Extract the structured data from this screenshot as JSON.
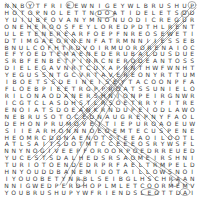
{
  "puzzle": {
    "type": "word-search",
    "columns": 25,
    "rows_count": 24,
    "letter_color": "#3a3a3a",
    "mark_color": "#8a8a8a",
    "rows": [
      "NNBYTFRIEEWNIGEYWLBRUSHUP",
      "HOTOPNOLETTNDOATIDELETSDD",
      "YUIUBFOVANYMNONUODICREGUR",
      "ONEHEROOSFEYLOREDPDTHLRENT",
      "ULETENEREARFOEPFNREOSEWETI",
      "DTIMGAEORNENFATRMNNIIESSEB",
      "BNULCOFHTRDVOIRMUORORENAIOC",
      "EFYOEDTEMAENEDERUBALDUSDUE",
      "SRBFENBETPINRCNERODEANTOSS",
      "DIELEGAVNRTCUYAPRNTHWFWNHT",
      "YEGUSSNTGCVRTAVEREONYRTTUM",
      "IBOETSSDEINEISEYTACOONPFA",
      "FLOEBPIEETRGPPROATSSUNIELO",
      "RILONAODANERSHNIONPEIRGNWR",
      "ICGTCLASDHSTLRSOETRRYFITRE",
      "ENOIATSDOEANKRNDUPEIODLAWO",
      "NEBRUSOTOCEDNAUGREPNYFAOL",
      "DEHONPRUMOVEITIEPUROAOEUW",
      "SIIEARHONNNOEOEMTECUSPENE",
      "HEOMRCDONAENOTSTEEAOILOOTL",
      "ATLSAITSDOTMTCCEEEOSRYWSFL",
      "NNYNOGIVEEPFOROORPOEDRREUED",
      "YUCESTSDALHEDSRSAOMEIRSHNI",
      "TURIOTOENDEDRPRFAELTRMPELD",
      "HNYOUDDBANEMIDOTAILLOWSNOI",
      "IYOUOBETYNRBLSEIBGLHSCHRAAN",
      "NNIGWEDPERDHOPLMLETCOORMEMV",
      "YOUBRUSHUPYWFRIENDSLEGTTDAI"
    ]
  }
}
